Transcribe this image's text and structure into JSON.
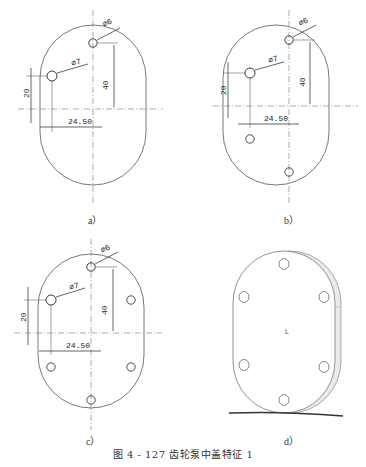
{
  "figure": {
    "caption": "图 4 - 127   齿轮泵中盖特征 1"
  },
  "panels": [
    {
      "id": "a",
      "label": "a）",
      "dims": {
        "d_small": "∅6",
        "d_large": "∅7",
        "v_left": "20",
        "v_right": "40",
        "h": "24.50"
      },
      "holes": 2
    },
    {
      "id": "b",
      "label": "b）",
      "dims": {
        "d_small": "∅6",
        "d_large": "∅7",
        "v_left": "20",
        "v_right": "40",
        "h": "24.50"
      },
      "holes": 4
    },
    {
      "id": "c",
      "label": "c）",
      "dims": {
        "d_small": "∅6",
        "d_large": "∅7",
        "v_left": "20",
        "v_right": "40",
        "h": "24.50"
      },
      "holes": 6
    },
    {
      "id": "d",
      "label": "d）",
      "view": "3D isometric",
      "center_mark": "L",
      "holes": 6
    }
  ]
}
